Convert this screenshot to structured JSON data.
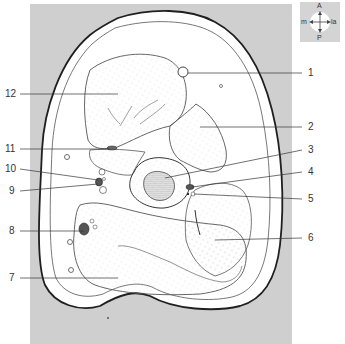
{
  "diagram": {
    "type": "anatomical cross-section",
    "background_color": "#cfcfcf",
    "line_color": "#2a2a2a",
    "labels": [
      {
        "id": "1",
        "text": "1",
        "x": 308,
        "y": 73
      },
      {
        "id": "2",
        "text": "2",
        "x": 308,
        "y": 127
      },
      {
        "id": "3",
        "text": "3",
        "x": 308,
        "y": 150
      },
      {
        "id": "4",
        "text": "4",
        "x": 308,
        "y": 172
      },
      {
        "id": "5",
        "text": "5",
        "x": 308,
        "y": 199
      },
      {
        "id": "6",
        "text": "6",
        "x": 308,
        "y": 238
      },
      {
        "id": "7",
        "text": "7",
        "x": 10,
        "y": 278
      },
      {
        "id": "8",
        "text": "8",
        "x": 10,
        "y": 231
      },
      {
        "id": "9",
        "text": "9",
        "x": 10,
        "y": 191
      },
      {
        "id": "10",
        "text": "10",
        "x": 6,
        "y": 169
      },
      {
        "id": "11",
        "text": "11",
        "x": 6,
        "y": 149
      },
      {
        "id": "12",
        "text": "12",
        "x": 6,
        "y": 94
      }
    ]
  },
  "compass": {
    "top": "A",
    "bottom": "P",
    "left": "m",
    "right": "la"
  }
}
